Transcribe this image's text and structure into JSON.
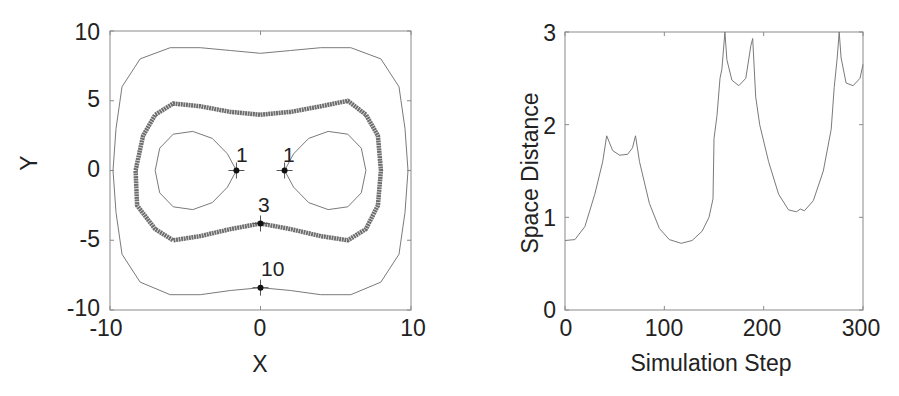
{
  "chart_data": [
    {
      "type": "line",
      "title": "",
      "xlabel": "X",
      "ylabel": "Y",
      "xlim": [
        -10,
        10
      ],
      "ylim": [
        -10,
        10
      ],
      "xticks": [
        "-10",
        "0",
        "10"
      ],
      "yticks": [
        "10",
        "5",
        "0",
        "-5",
        "-10"
      ],
      "grid": false,
      "legend": null,
      "description": "Contour curves of equal space distance around two fixed points",
      "series": [
        {
          "name": "contour-1-left",
          "style": "thin",
          "points": [
            [
              -1.6,
              0
            ],
            [
              -2.2,
              1.2
            ],
            [
              -3.2,
              2.3
            ],
            [
              -4.5,
              2.8
            ],
            [
              -5.8,
              2.6
            ],
            [
              -6.7,
              1.6
            ],
            [
              -7.0,
              0
            ],
            [
              -6.7,
              -1.6
            ],
            [
              -5.8,
              -2.6
            ],
            [
              -4.5,
              -2.8
            ],
            [
              -3.2,
              -2.3
            ],
            [
              -2.2,
              -1.2
            ],
            [
              -1.6,
              0
            ]
          ]
        },
        {
          "name": "contour-1-right",
          "style": "thin",
          "points": [
            [
              1.6,
              0
            ],
            [
              2.2,
              1.2
            ],
            [
              3.2,
              2.3
            ],
            [
              4.5,
              2.8
            ],
            [
              5.8,
              2.6
            ],
            [
              6.7,
              1.6
            ],
            [
              7.0,
              0
            ],
            [
              6.7,
              -1.6
            ],
            [
              5.8,
              -2.6
            ],
            [
              4.5,
              -2.8
            ],
            [
              3.2,
              -2.3
            ],
            [
              2.2,
              -1.2
            ],
            [
              1.6,
              0
            ]
          ]
        },
        {
          "name": "contour-3",
          "style": "thick",
          "points": [
            [
              0,
              4.0
            ],
            [
              2,
              4.2
            ],
            [
              4,
              4.6
            ],
            [
              5.8,
              5.0
            ],
            [
              7,
              4.0
            ],
            [
              7.8,
              2.5
            ],
            [
              8.0,
              0
            ],
            [
              7.8,
              -2.5
            ],
            [
              7,
              -4.2
            ],
            [
              5.8,
              -5.0
            ],
            [
              4,
              -4.7
            ],
            [
              2,
              -4.2
            ],
            [
              0,
              -3.8
            ],
            [
              -2,
              -4.2
            ],
            [
              -4,
              -4.7
            ],
            [
              -5.8,
              -5.0
            ],
            [
              -7,
              -4.2
            ],
            [
              -8.2,
              -2.5
            ],
            [
              -8.3,
              0
            ],
            [
              -7.8,
              2.5
            ],
            [
              -7,
              4.0
            ],
            [
              -5.8,
              4.8
            ],
            [
              -4,
              4.6
            ],
            [
              -2,
              4.2
            ],
            [
              0,
              4.0
            ]
          ]
        },
        {
          "name": "contour-10",
          "style": "thin",
          "points": [
            [
              0,
              8.4
            ],
            [
              2,
              8.6
            ],
            [
              4,
              8.8
            ],
            [
              6,
              8.8
            ],
            [
              8,
              8.0
            ],
            [
              9.2,
              6
            ],
            [
              9.6,
              3
            ],
            [
              9.8,
              0
            ],
            [
              9.6,
              -3
            ],
            [
              9.2,
              -6
            ],
            [
              8,
              -8.0
            ],
            [
              6,
              -8.9
            ],
            [
              4,
              -8.9
            ],
            [
              2,
              -8.6
            ],
            [
              0,
              -8.4
            ],
            [
              -2,
              -8.6
            ],
            [
              -4,
              -8.9
            ],
            [
              -6,
              -8.9
            ],
            [
              -8,
              -8.0
            ],
            [
              -9.2,
              -6
            ],
            [
              -9.6,
              -3
            ],
            [
              -9.8,
              0
            ],
            [
              -9.6,
              3
            ],
            [
              -9.2,
              6
            ],
            [
              -8,
              8.0
            ],
            [
              -6,
              8.8
            ],
            [
              -4,
              8.8
            ],
            [
              -2,
              8.6
            ],
            [
              0,
              8.4
            ]
          ]
        }
      ],
      "markers": [
        {
          "label": "1",
          "x": -1.6,
          "y": 0
        },
        {
          "label": "1",
          "x": 1.6,
          "y": 0
        },
        {
          "label": "3",
          "x": 0,
          "y": -3.8
        },
        {
          "label": "10",
          "x": 0,
          "y": -8.4
        }
      ]
    },
    {
      "type": "line",
      "title": "",
      "xlabel": "Simulation Step",
      "ylabel": "Space Distance",
      "xlim": [
        0,
        300
      ],
      "ylim": [
        0,
        3
      ],
      "xticks": [
        "0",
        "100",
        "200",
        "300"
      ],
      "yticks": [
        "3",
        "2",
        "1",
        "0"
      ],
      "grid": false,
      "legend": null,
      "series": [
        {
          "name": "space-distance",
          "x": [
            0,
            10,
            20,
            30,
            38,
            42,
            48,
            55,
            63,
            68,
            71,
            75,
            85,
            95,
            105,
            117,
            128,
            138,
            145,
            149,
            150,
            153,
            156,
            158,
            161,
            163,
            168,
            175,
            182,
            187,
            189,
            192,
            196,
            205,
            215,
            225,
            233,
            237,
            241,
            250,
            260,
            268,
            271,
            274,
            276,
            278,
            283,
            290,
            297,
            300
          ],
          "values": [
            0.75,
            0.76,
            0.9,
            1.25,
            1.6,
            1.88,
            1.72,
            1.67,
            1.68,
            1.75,
            1.88,
            1.6,
            1.15,
            0.88,
            0.76,
            0.72,
            0.75,
            0.85,
            1.0,
            1.2,
            1.85,
            2.1,
            2.5,
            2.6,
            3.0,
            2.7,
            2.48,
            2.42,
            2.5,
            2.85,
            2.93,
            2.3,
            2.0,
            1.6,
            1.25,
            1.08,
            1.06,
            1.09,
            1.07,
            1.18,
            1.5,
            1.95,
            2.4,
            2.72,
            3.0,
            2.72,
            2.45,
            2.42,
            2.5,
            2.65
          ]
        }
      ]
    }
  ],
  "left_plot": {
    "xlabel": "X",
    "ylabel": "Y",
    "xticks": [
      "-10",
      "0",
      "10"
    ],
    "yticks": [
      "10",
      "5",
      "0",
      "-5",
      "-10"
    ],
    "annotations": [
      "1",
      "1",
      "3",
      "10"
    ]
  },
  "right_plot": {
    "xlabel": "Simulation Step",
    "ylabel": "Space Distance",
    "xticks": [
      "0",
      "100",
      "200",
      "300"
    ],
    "yticks": [
      "3",
      "2",
      "1",
      "0"
    ]
  },
  "colors": {
    "axis": "#8a8a8a",
    "thin_line": "#7a7a7a",
    "thick_line": "#6e6e6e",
    "marker": "#111111",
    "text": "#222222"
  }
}
